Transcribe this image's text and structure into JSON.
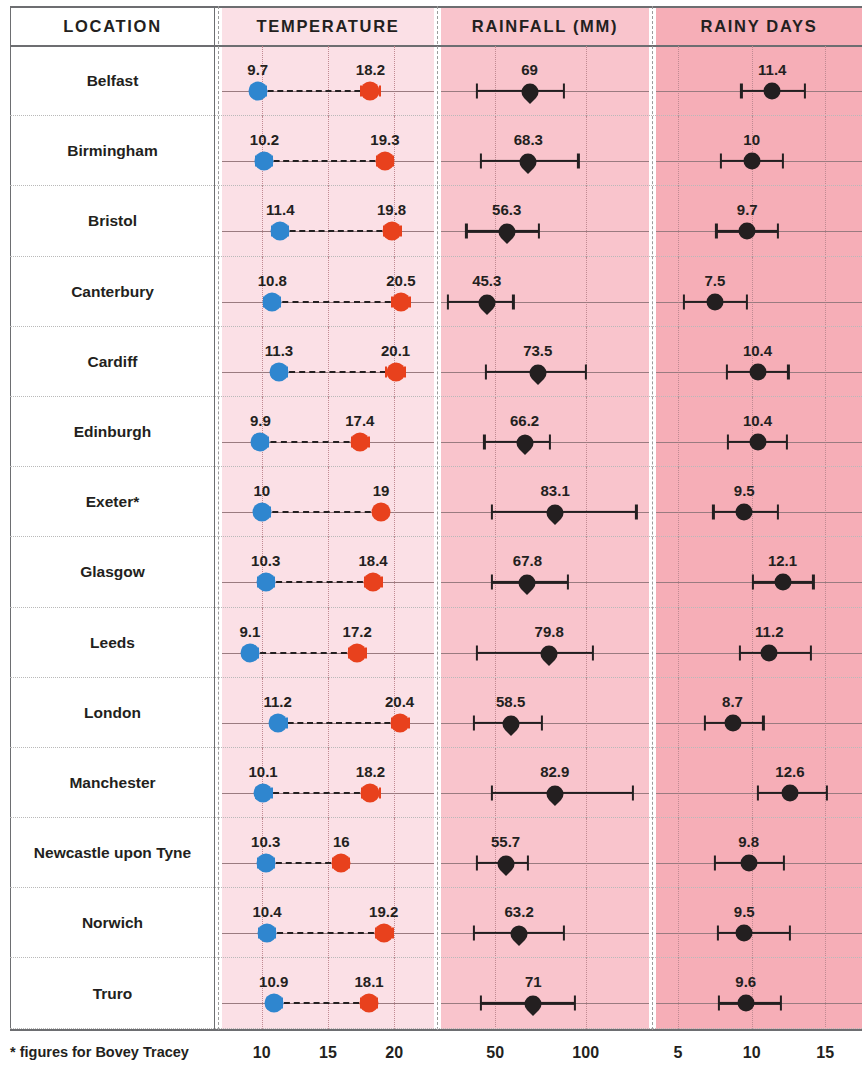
{
  "table": {
    "headers": {
      "location": "LOCATION",
      "temperature": "TEMPERATURE",
      "rainfall": "RAINFALL (MM)",
      "rainy_days": "RAINY DAYS"
    },
    "footnote": "* figures for Bovey Tracey"
  },
  "colors": {
    "min_temp": "#2f86cf",
    "max_temp": "#e8411d",
    "marker": "#231f20",
    "band_location": "#ffffff",
    "band_temperature": "#fbe0e6",
    "band_rainfall": "#f9c4cc",
    "band_rainy_days": "#f6aeb7"
  },
  "axes": {
    "temperature": {
      "ticks": [
        10,
        15,
        20
      ],
      "labels": [
        "10",
        "15",
        "20"
      ],
      "min": 7.0,
      "max": 23.0
    },
    "rainfall": {
      "ticks": [
        50,
        100
      ],
      "labels": [
        "50",
        "100"
      ],
      "min": 20,
      "max": 135
    },
    "rainy_days": {
      "ticks": [
        5,
        10,
        15
      ],
      "labels": [
        "5",
        "10",
        "15"
      ],
      "min": 3.5,
      "max": 17.5
    }
  },
  "chart_data": {
    "type": "scatter",
    "categories": [
      "Belfast",
      "Birmingham",
      "Bristol",
      "Canterbury",
      "Cardiff",
      "Edinburgh",
      "Exeter*",
      "Glasgow",
      "Leeds",
      "London",
      "Manchester",
      "Newcastle upon Tyne",
      "Norwich",
      "Truro"
    ],
    "series": [
      {
        "name": "Minimum temperature",
        "unit": "°C",
        "values": [
          9.7,
          10.2,
          11.4,
          10.8,
          11.3,
          9.9,
          10,
          10.3,
          9.1,
          11.2,
          10.1,
          10.3,
          10.4,
          10.9
        ]
      },
      {
        "name": "Maximum temperature",
        "unit": "°C",
        "values": [
          18.2,
          19.3,
          19.8,
          20.5,
          20.1,
          17.4,
          19,
          18.4,
          17.2,
          20.4,
          18.2,
          16,
          19.2,
          18.1
        ]
      },
      {
        "name": "Rainfall",
        "unit": "mm",
        "values": [
          69,
          68.3,
          56.3,
          45.3,
          73.5,
          66.2,
          83.1,
          67.8,
          79.8,
          58.5,
          82.9,
          55.7,
          63.2,
          71
        ]
      },
      {
        "name": "Rainy days",
        "unit": "days",
        "values": [
          11.4,
          10,
          9.7,
          7.5,
          10.4,
          10.4,
          9.5,
          12.1,
          11.2,
          8.7,
          12.6,
          9.8,
          9.5,
          9.6
        ]
      }
    ],
    "xlabel": "",
    "ylabel": "",
    "grid": true,
    "legend": "none"
  },
  "rows": [
    {
      "location": "Belfast",
      "min_temp": "9.7",
      "max_temp": "18.2",
      "rainfall": "69",
      "rainy_days": "11.4",
      "min_temp_v": 9.7,
      "max_temp_v": 18.2,
      "rainfall_v": 69,
      "rainy_days_v": 11.4,
      "min_lo": 9.2,
      "min_hi": 10.3,
      "max_lo": 17.5,
      "max_hi": 18.9,
      "rain_lo": 40,
      "rain_hi": 88,
      "days_lo": 9.3,
      "days_hi": 13.6
    },
    {
      "location": "Birmingham",
      "min_temp": "10.2",
      "max_temp": "19.3",
      "rainfall": "68.3",
      "rainy_days": "10",
      "min_temp_v": 10.2,
      "max_temp_v": 19.3,
      "rainfall_v": 68.3,
      "rainy_days_v": 10,
      "min_lo": 9.6,
      "min_hi": 10.8,
      "max_lo": 18.7,
      "max_hi": 19.9,
      "rain_lo": 42,
      "rain_hi": 96,
      "days_lo": 7.9,
      "days_hi": 12.1
    },
    {
      "location": "Bristol",
      "min_temp": "11.4",
      "max_temp": "19.8",
      "rainfall": "56.3",
      "rainy_days": "9.7",
      "min_temp_v": 11.4,
      "max_temp_v": 19.8,
      "rainfall_v": 56.3,
      "rainy_days_v": 9.7,
      "min_lo": 10.8,
      "min_hi": 12.0,
      "max_lo": 19.2,
      "max_hi": 20.5,
      "rain_lo": 34,
      "rain_hi": 74,
      "days_lo": 7.6,
      "days_hi": 11.8
    },
    {
      "location": "Canterbury",
      "min_temp": "10.8",
      "max_temp": "20.5",
      "rainfall": "45.3",
      "rainy_days": "7.5",
      "min_temp_v": 10.8,
      "max_temp_v": 20.5,
      "rainfall_v": 45.3,
      "rainy_days_v": 7.5,
      "min_lo": 10.2,
      "min_hi": 11.4,
      "max_lo": 19.8,
      "max_hi": 21.2,
      "rain_lo": 24,
      "rain_hi": 60,
      "days_lo": 5.4,
      "days_hi": 9.7
    },
    {
      "location": "Cardiff",
      "min_temp": "11.3",
      "max_temp": "20.1",
      "rainfall": "73.5",
      "rainy_days": "10.4",
      "min_temp_v": 11.3,
      "max_temp_v": 20.1,
      "rainfall_v": 73.5,
      "rainy_days_v": 10.4,
      "min_lo": 10.8,
      "min_hi": 11.9,
      "max_lo": 19.4,
      "max_hi": 20.8,
      "rain_lo": 45,
      "rain_hi": 100,
      "days_lo": 8.3,
      "days_hi": 12.5
    },
    {
      "location": "Edinburgh",
      "min_temp": "9.9",
      "max_temp": "17.4",
      "rainfall": "66.2",
      "rainy_days": "10.4",
      "min_temp_v": 9.9,
      "max_temp_v": 17.4,
      "rainfall_v": 66.2,
      "rainy_days_v": 10.4,
      "min_lo": 9.4,
      "min_hi": 10.5,
      "max_lo": 16.8,
      "max_hi": 18.1,
      "rain_lo": 44,
      "rain_hi": 80,
      "days_lo": 8.4,
      "days_hi": 12.4
    },
    {
      "location": "Exeter*",
      "min_temp": "10",
      "max_temp": "19",
      "rainfall": "83.1",
      "rainy_days": "9.5",
      "min_temp_v": 10,
      "max_temp_v": 19,
      "rainfall_v": 83.1,
      "rainy_days_v": 9.5,
      "min_lo": 9.6,
      "min_hi": 10.6,
      "max_lo": 18.6,
      "max_hi": 19.4,
      "rain_lo": 48,
      "rain_hi": 128,
      "days_lo": 7.4,
      "days_hi": 11.8
    },
    {
      "location": "Glasgow",
      "min_temp": "10.3",
      "max_temp": "18.4",
      "rainfall": "67.8",
      "rainy_days": "12.1",
      "min_temp_v": 10.3,
      "max_temp_v": 18.4,
      "rainfall_v": 67.8,
      "rainy_days_v": 12.1,
      "min_lo": 9.7,
      "min_hi": 10.9,
      "max_lo": 17.8,
      "max_hi": 19.1,
      "rain_lo": 48,
      "rain_hi": 90,
      "days_lo": 10.1,
      "days_hi": 14.2
    },
    {
      "location": "Leeds",
      "min_temp": "9.1",
      "max_temp": "17.2",
      "rainfall": "79.8",
      "rainy_days": "11.2",
      "min_temp_v": 9.1,
      "max_temp_v": 17.2,
      "rainfall_v": 79.8,
      "rainy_days_v": 11.2,
      "min_lo": 8.6,
      "min_hi": 9.7,
      "max_lo": 16.6,
      "max_hi": 17.9,
      "rain_lo": 40,
      "rain_hi": 104,
      "days_lo": 9.2,
      "days_hi": 14.0
    },
    {
      "location": "London",
      "min_temp": "11.2",
      "max_temp": "20.4",
      "rainfall": "58.5",
      "rainy_days": "8.7",
      "min_temp_v": 11.2,
      "max_temp_v": 20.4,
      "rainfall_v": 58.5,
      "rainy_days_v": 8.7,
      "min_lo": 10.7,
      "min_hi": 11.9,
      "max_lo": 19.8,
      "max_hi": 21.1,
      "rain_lo": 38,
      "rain_hi": 76,
      "days_lo": 6.8,
      "days_hi": 10.8
    },
    {
      "location": "Manchester",
      "min_temp": "10.1",
      "max_temp": "18.2",
      "rainfall": "82.9",
      "rainy_days": "12.6",
      "min_temp_v": 10.1,
      "max_temp_v": 18.2,
      "rainfall_v": 82.9,
      "rainy_days_v": 12.6,
      "min_lo": 9.6,
      "min_hi": 10.8,
      "max_lo": 17.6,
      "max_hi": 18.9,
      "rain_lo": 48,
      "rain_hi": 126,
      "days_lo": 10.4,
      "days_hi": 15.1
    },
    {
      "location": "Newcastle upon Tyne",
      "min_temp": "10.3",
      "max_temp": "16",
      "rainfall": "55.7",
      "rainy_days": "9.8",
      "min_temp_v": 10.3,
      "max_temp_v": 16,
      "rainfall_v": 55.7,
      "rainy_days_v": 9.8,
      "min_lo": 9.7,
      "min_hi": 10.9,
      "max_lo": 15.4,
      "max_hi": 16.6,
      "rain_lo": 40,
      "rain_hi": 68,
      "days_lo": 7.5,
      "days_hi": 12.2
    },
    {
      "location": "Norwich",
      "min_temp": "10.4",
      "max_temp": "19.2",
      "rainfall": "63.2",
      "rainy_days": "9.5",
      "min_temp_v": 10.4,
      "max_temp_v": 19.2,
      "rainfall_v": 63.2,
      "rainy_days_v": 9.5,
      "min_lo": 9.8,
      "min_hi": 11.0,
      "max_lo": 18.6,
      "max_hi": 19.9,
      "rain_lo": 38,
      "rain_hi": 88,
      "days_lo": 7.7,
      "days_hi": 12.6
    },
    {
      "location": "Truro",
      "min_temp": "10.9",
      "max_temp": "18.1",
      "rainfall": "71",
      "rainy_days": "9.6",
      "min_temp_v": 10.9,
      "max_temp_v": 18.1,
      "rainfall_v": 71,
      "rainy_days_v": 9.6,
      "min_lo": 10.4,
      "min_hi": 11.5,
      "max_lo": 17.5,
      "max_hi": 18.7,
      "rain_lo": 42,
      "rain_hi": 94,
      "days_lo": 7.8,
      "days_hi": 12.0
    }
  ]
}
